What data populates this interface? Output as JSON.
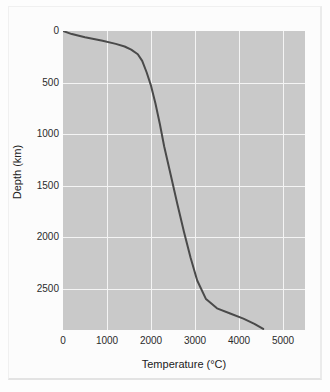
{
  "chart_data": {
    "type": "line",
    "title": "",
    "xlabel": "Temperature (°C)",
    "ylabel": "Depth (km)",
    "xlim": [
      0,
      5500
    ],
    "ylim": [
      0,
      2900
    ],
    "y_inverted": true,
    "grid": true,
    "legend": null,
    "xticks": [
      0,
      1000,
      2000,
      3000,
      4000,
      5000
    ],
    "xtick_labels": [
      "0",
      "1000",
      "2000",
      "3000",
      "4000",
      "5000"
    ],
    "yticks": [
      0,
      500,
      1000,
      1500,
      2000,
      2500
    ],
    "ytick_labels": [
      "0",
      "500",
      "1000",
      "1500",
      "2000",
      "2500"
    ],
    "series": [
      {
        "name": "Geotherm",
        "color": "#4a4a4a",
        "line_width": 2.0,
        "x": [
          0,
          200,
          500,
          900,
          1200,
          1400,
          1550,
          1700,
          1800,
          1900,
          2000,
          2100,
          2200,
          2300,
          2450,
          2600,
          2750,
          2900,
          3050,
          3250,
          3500,
          3800,
          4100,
          4350,
          4550
        ],
        "y": [
          0,
          30,
          60,
          95,
          125,
          150,
          180,
          225,
          290,
          400,
          530,
          700,
          900,
          1120,
          1400,
          1680,
          1950,
          2200,
          2420,
          2600,
          2690,
          2740,
          2790,
          2840,
          2890
        ]
      }
    ],
    "colors": {
      "plot_background": "#c9c9c9",
      "grid_line": "#f4f4f4",
      "curve": "#4a4a4a",
      "figure_background": "#fcfcfc",
      "tick_text": "#2b2b2b"
    }
  }
}
